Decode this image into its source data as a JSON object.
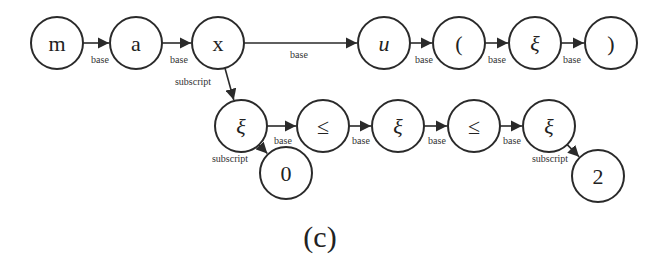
{
  "figure": {
    "caption": "(c)",
    "caption_pos": [
      320,
      236
    ],
    "stroke_color": "#2a2a2a",
    "background": "#ffffff",
    "node_radius": 26
  },
  "nodes": [
    {
      "id": "n_m",
      "label": "m",
      "x": 57,
      "y": 43,
      "italic": false
    },
    {
      "id": "n_a",
      "label": "a",
      "x": 136,
      "y": 43,
      "italic": false
    },
    {
      "id": "n_x",
      "label": "x",
      "x": 218,
      "y": 43,
      "italic": false
    },
    {
      "id": "n_u",
      "label": "u",
      "x": 384,
      "y": 43,
      "italic": true
    },
    {
      "id": "n_lparen",
      "label": "(",
      "x": 459,
      "y": 43,
      "italic": false
    },
    {
      "id": "n_xi1",
      "label": "ξ",
      "x": 535,
      "y": 43,
      "italic": true
    },
    {
      "id": "n_rparen",
      "label": ")",
      "x": 611,
      "y": 43,
      "italic": false
    },
    {
      "id": "n_xi2",
      "label": "ξ",
      "x": 241,
      "y": 126,
      "italic": true
    },
    {
      "id": "n_le1",
      "label": "≤",
      "x": 323,
      "y": 126,
      "italic": false
    },
    {
      "id": "n_xi3",
      "label": "ξ",
      "x": 398,
      "y": 126,
      "italic": true
    },
    {
      "id": "n_le2",
      "label": "≤",
      "x": 474,
      "y": 126,
      "italic": false
    },
    {
      "id": "n_xi4",
      "label": "ξ",
      "x": 549,
      "y": 126,
      "italic": true
    },
    {
      "id": "n_zero",
      "label": "0",
      "x": 286,
      "y": 173,
      "italic": false
    },
    {
      "id": "n_two",
      "label": "2",
      "x": 598,
      "y": 176,
      "italic": false
    }
  ],
  "edges": [
    {
      "from": "n_m",
      "to": "n_a",
      "label": "base",
      "label_pos": [
        100,
        63
      ]
    },
    {
      "from": "n_a",
      "to": "n_x",
      "label": "base",
      "label_pos": [
        179,
        63
      ]
    },
    {
      "from": "n_x",
      "to": "n_u",
      "label": "base",
      "label_pos": [
        299,
        58
      ]
    },
    {
      "from": "n_u",
      "to": "n_lparen",
      "label": "base",
      "label_pos": [
        424,
        63
      ]
    },
    {
      "from": "n_lparen",
      "to": "n_xi1",
      "label": "base",
      "label_pos": [
        497,
        63
      ]
    },
    {
      "from": "n_xi1",
      "to": "n_rparen",
      "label": "base",
      "label_pos": [
        572,
        63
      ]
    },
    {
      "from": "n_x",
      "to": "n_xi2",
      "label": "subscript",
      "label_pos": [
        193,
        85
      ]
    },
    {
      "from": "n_xi2",
      "to": "n_le1",
      "label": "base",
      "label_pos": [
        283,
        144
      ]
    },
    {
      "from": "n_le1",
      "to": "n_xi3",
      "label": "base",
      "label_pos": [
        361,
        144
      ]
    },
    {
      "from": "n_xi3",
      "to": "n_le2",
      "label": "base",
      "label_pos": [
        437,
        144
      ]
    },
    {
      "from": "n_le2",
      "to": "n_xi4",
      "label": "base",
      "label_pos": [
        512,
        144
      ]
    },
    {
      "from": "n_xi2",
      "to": "n_zero",
      "label": "subscript",
      "label_pos": [
        230,
        162
      ]
    },
    {
      "from": "n_xi4",
      "to": "n_two",
      "label": "subscript",
      "label_pos": [
        550,
        162
      ]
    }
  ]
}
